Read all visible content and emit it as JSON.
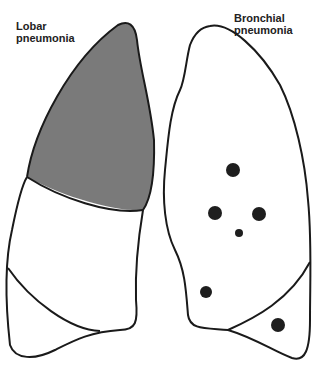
{
  "labels": {
    "left": "Lobar\npneumonia",
    "right": "Bronchial\npneumonia"
  },
  "colors": {
    "outline": "#1a1a1a",
    "consolidation": "#7a7a7a",
    "background": "#ffffff",
    "patch": "#1e1e1e"
  },
  "diagram": {
    "left_lung": {
      "condition": "Lobar pneumonia",
      "shaded_region": "upper lobe consolidation"
    },
    "right_lung": {
      "condition": "Bronchial pneumonia",
      "patches": 7
    }
  }
}
